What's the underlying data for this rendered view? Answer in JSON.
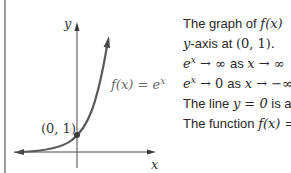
{
  "figure": {
    "axis_labels": {
      "x": "x",
      "y": "y"
    },
    "point_label": "(0, 1)",
    "curve_label": {
      "base": "f(x) = e",
      "exp": "x"
    },
    "colors": {
      "axis": "#4a4a4a",
      "curve": "#5a5a5a",
      "border": "#555555",
      "point": "#3a3a3a"
    }
  },
  "ghost_text": {
    "base": "e",
    "exp": "x"
  },
  "text": {
    "line1": {
      "pre": "The graph of ",
      "math": "f(x)",
      "post": " "
    },
    "line2": {
      "math_pre": "y",
      "mid": "-axis at ",
      "math": "(0, 1)."
    },
    "line3": {
      "e": "e",
      "exp": "x",
      "arrow1": " → ∞ ",
      "as": "as ",
      "x": "x",
      "arrow2": " → ∞"
    },
    "line4": {
      "e": "e",
      "exp": "x",
      "arrow1": " → 0 ",
      "as": "as ",
      "x": "x",
      "arrow2": " → −∞"
    },
    "line5": {
      "pre": "The line ",
      "math": "y = 0",
      "post": " is a"
    },
    "line6": {
      "pre": "The function ",
      "math": "f(x) ="
    }
  }
}
